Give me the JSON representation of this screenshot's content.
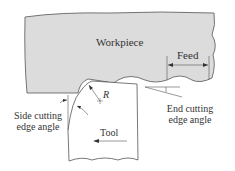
{
  "diagram": {
    "labels": {
      "workpiece": "Workpiece",
      "feed": "Feed",
      "radius": "R",
      "side_cutting_line1": "Side cutting",
      "side_cutting_line2": "edge angle",
      "end_cutting_line1": "End cutting",
      "end_cutting_line2": "edge angle",
      "tool": "Tool"
    },
    "colors": {
      "workpiece_fill": "#dcdcdc",
      "outline": "#555555",
      "background": "#ffffff"
    }
  }
}
